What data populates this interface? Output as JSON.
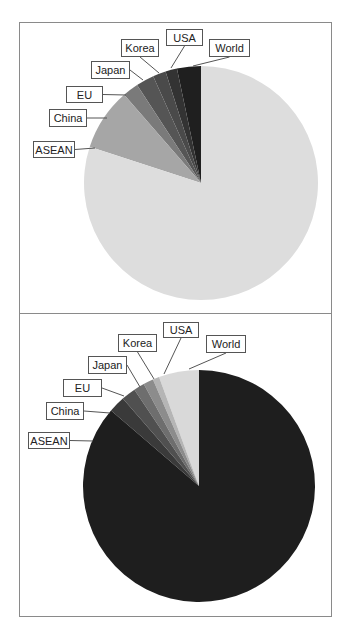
{
  "chart_data": [
    {
      "type": "pie",
      "title": "",
      "start_angle_deg": 0,
      "direction": "counterclockwise",
      "categories": [
        "World",
        "USA",
        "Korea",
        "Japan",
        "EU",
        "China",
        "ASEAN"
      ],
      "values": [
        3.3,
        1.6,
        1.8,
        2.5,
        2.2,
        8.6,
        80.0
      ],
      "colors": [
        "#1f1f1f",
        "#333333",
        "#4a4a4a",
        "#555555",
        "#7a7a7a",
        "#a6a6a6",
        "#dddddd"
      ],
      "center": [
        201,
        183
      ],
      "radius": 117,
      "labels": [
        {
          "text": "World",
          "box": [
            209,
            39,
            41,
            18
          ],
          "anchor": [
            193,
            66
          ]
        },
        {
          "text": "USA",
          "box": [
            166,
            29,
            37,
            17
          ],
          "anchor": [
            171,
            68
          ]
        },
        {
          "text": "Korea",
          "box": [
            121,
            39,
            38,
            18
          ],
          "anchor": [
            159,
            73
          ]
        },
        {
          "text": "Japan",
          "box": [
            91,
            61,
            39,
            18
          ],
          "anchor": [
            143,
            80
          ]
        },
        {
          "text": "EU",
          "box": [
            66,
            86,
            37,
            17
          ],
          "anchor": [
            126,
            95
          ]
        },
        {
          "text": "China",
          "box": [
            49,
            109,
            38,
            18
          ],
          "anchor": [
            107,
            118
          ]
        },
        {
          "text": "ASEAN",
          "box": [
            33,
            141,
            42,
            17
          ],
          "anchor": [
            95,
            148
          ]
        }
      ]
    },
    {
      "type": "pie",
      "title": "",
      "start_angle_deg": 0,
      "direction": "counterclockwise",
      "categories": [
        "World",
        "USA",
        "Korea",
        "Japan",
        "EU",
        "China",
        "ASEAN"
      ],
      "values": [
        5.6,
        0.9,
        1.4,
        1.5,
        2.0,
        2.3,
        86.3
      ],
      "colors": [
        "#d9d9d9",
        "#b5b5b5",
        "#8c8c8c",
        "#6e6e6e",
        "#505050",
        "#3a3a3a",
        "#1e1e1e"
      ],
      "center": [
        199,
        486
      ],
      "radius": 116,
      "labels": [
        {
          "text": "World",
          "box": [
            206,
            335,
            40,
            18
          ],
          "anchor": [
            189,
            369
          ]
        },
        {
          "text": "USA",
          "box": [
            163,
            322,
            36,
            16
          ],
          "anchor": [
            164,
            374
          ]
        },
        {
          "text": "Korea",
          "box": [
            118,
            334,
            39,
            18
          ],
          "anchor": [
            154,
            379
          ]
        },
        {
          "text": "Japan",
          "box": [
            88,
            356,
            39,
            18
          ],
          "anchor": [
            140,
            387
          ]
        },
        {
          "text": "EU",
          "box": [
            63,
            379,
            39,
            18
          ],
          "anchor": [
            124,
            396
          ]
        },
        {
          "text": "China",
          "box": [
            46,
            402,
            38,
            18
          ],
          "anchor": [
            110,
            413
          ]
        },
        {
          "text": "ASEAN",
          "box": [
            28,
            432,
            42,
            17
          ],
          "anchor": [
            93,
            441
          ]
        }
      ]
    }
  ]
}
